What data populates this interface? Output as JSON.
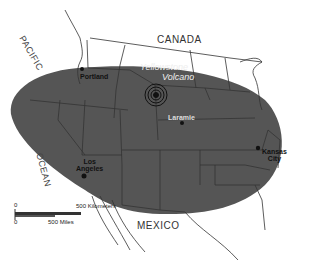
{
  "map": {
    "title": "Yellowstone Volcano ash fall extent",
    "colors": {
      "ash_zone": "#555555",
      "borders": "#333333",
      "background": "#ffffff"
    },
    "labels": {
      "countries": [
        {
          "name": "CANADA"
        },
        {
          "name": "MEXICO"
        }
      ],
      "ocean": {
        "line1": "PACIFIC",
        "line2": "OCEAN"
      },
      "volcano": {
        "line1": "Yellowstone",
        "line2": "Volcano"
      },
      "cities": [
        {
          "name": "Portland"
        },
        {
          "name": "Laramie"
        },
        {
          "name_line1": "Los",
          "name_line2": "Angeles"
        },
        {
          "name_line1": "Kansas",
          "name_line2": "City"
        }
      ]
    },
    "scale_bar": {
      "km_start": "0",
      "km_label": "500 Kilometers",
      "mi_start": "0",
      "mi_label": "500 Miles"
    }
  }
}
